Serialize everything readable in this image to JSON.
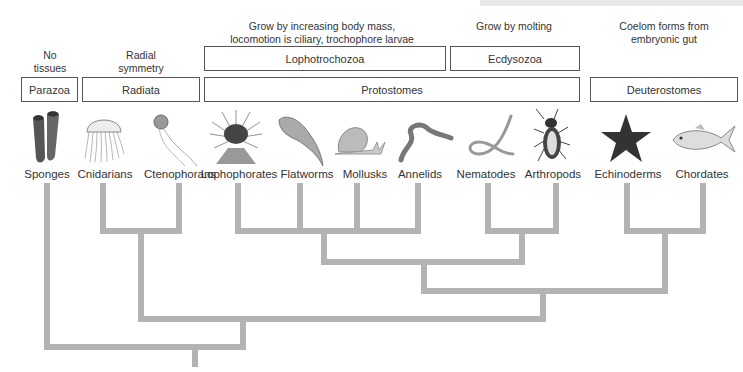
{
  "diagram": {
    "type": "phylogenetic-tree",
    "characteristics": {
      "no_tissues": "No\ntissues",
      "no_tissues_line1": "No",
      "no_tissues_line2": "tissues",
      "radial_line1": "Radial",
      "radial_line2": "symmetry",
      "lopho_line1": "Grow by increasing body mass,",
      "lopho_line2": "locomotion is ciliary, trochophore larvae",
      "ecdy_line1": "Grow by molting",
      "deut_line1": "Coelom forms from",
      "deut_line2": "embryonic gut"
    },
    "groups": {
      "parazoa": "Parazoa",
      "radiata": "Radiata",
      "lophotrochozoa": "Lophotrochozoa",
      "ecdysozoa": "Ecdysozoa",
      "protostomes": "Protostomes",
      "deuterostomes": "Deuterostomes"
    },
    "taxa": [
      {
        "name": "Sponges",
        "icon": "sponge-icon"
      },
      {
        "name": "Cnidarians",
        "icon": "jellyfish-icon"
      },
      {
        "name": "Ctenophorans",
        "icon": "comb-jelly-icon"
      },
      {
        "name": "Lophophorates",
        "icon": "lophophorate-icon"
      },
      {
        "name": "Flatworms",
        "icon": "flatworm-icon"
      },
      {
        "name": "Mollusks",
        "icon": "snail-icon"
      },
      {
        "name": "Annelids",
        "icon": "earthworm-icon"
      },
      {
        "name": "Nematodes",
        "icon": "roundworm-icon"
      },
      {
        "name": "Arthropods",
        "icon": "beetle-icon"
      },
      {
        "name": "Echinoderms",
        "icon": "starfish-icon"
      },
      {
        "name": "Chordates",
        "icon": "fish-icon"
      }
    ],
    "colors": {
      "branch": "#b3b3b3",
      "box_border": "#555555",
      "text": "#333333"
    }
  }
}
